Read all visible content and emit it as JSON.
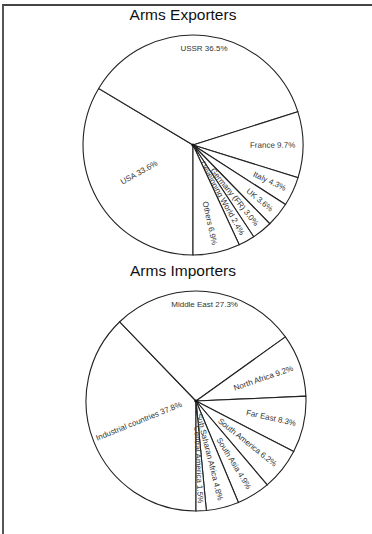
{
  "chart_data": [
    {
      "type": "pie",
      "title": "Arms Exporters",
      "start_angle_deg": 90,
      "direction": "clockwise",
      "center": [
        193,
        145
      ],
      "radius": 110,
      "slices": [
        {
          "label": "USA",
          "value": 33.6,
          "text": "USA  33.6%"
        },
        {
          "label": "USSR",
          "value": 36.5,
          "text": "USSR  36.5%"
        },
        {
          "label": "France",
          "value": 9.7,
          "text": "France  9.7%"
        },
        {
          "label": "Italy",
          "value": 4.3,
          "text": "Italy  4.3%"
        },
        {
          "label": "UK",
          "value": 3.6,
          "text": "UK  3.6%"
        },
        {
          "label": "Germany (FR)",
          "value": 3.0,
          "text": "Germany (FR)  3.0%"
        },
        {
          "label": "Developing World",
          "value": 2.4,
          "text": "Developing World  2.4%"
        },
        {
          "label": "Others",
          "value": 6.9,
          "text": "Others  6.9%"
        }
      ]
    },
    {
      "type": "pie",
      "title": "Arms Importers",
      "start_angle_deg": 90,
      "direction": "clockwise",
      "center": [
        196,
        401
      ],
      "radius": 110,
      "slices": [
        {
          "label": "Industrial countries",
          "value": 37.8,
          "text": "Industrial countries  37.8%"
        },
        {
          "label": "Middle East",
          "value": 27.3,
          "text": "Middle East  27.3%"
        },
        {
          "label": "North Africa",
          "value": 9.2,
          "text": "North Africa  9.2%"
        },
        {
          "label": "Far East",
          "value": 8.3,
          "text": "Far East  8.3%"
        },
        {
          "label": "South America",
          "value": 6.2,
          "text": "South America  6.2%"
        },
        {
          "label": "South Asia",
          "value": 4.9,
          "text": "South Asia  4.9%"
        },
        {
          "label": "Sub Saharan Africa",
          "value": 4.8,
          "text": "Sub Saharan Africa  4.8%"
        },
        {
          "label": "Central America",
          "value": 1.5,
          "text": "Central America  1.5%"
        }
      ]
    }
  ],
  "titles": {
    "exporters": "Arms Exporters",
    "importers": "Arms Importers"
  }
}
